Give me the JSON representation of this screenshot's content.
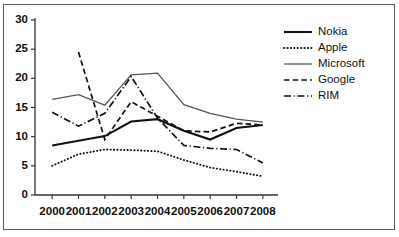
{
  "chart_data": {
    "type": "line",
    "title": "",
    "subtitle": "",
    "xlabel": "",
    "ylabel": "",
    "categories": [
      "2000",
      "2001",
      "2002",
      "2003",
      "2004",
      "2005",
      "2006",
      "2007",
      "2008"
    ],
    "x": [
      2000,
      2001,
      2002,
      2003,
      2004,
      2005,
      2006,
      2007,
      2008
    ],
    "ylim": [
      0,
      30
    ],
    "yticks": [
      "0",
      "5",
      "10",
      "15",
      "20",
      "25",
      "30"
    ],
    "ytick_values": [
      0,
      5,
      10,
      15,
      20,
      25,
      30
    ],
    "grid": false,
    "legend_position": "top-right",
    "series": [
      {
        "name": "Nokia",
        "style": "solid-thick",
        "values": [
          8.5,
          9.3,
          10.1,
          12.6,
          13.0,
          11.0,
          9.5,
          11.5,
          12.0
        ]
      },
      {
        "name": "Apple",
        "style": "dotted",
        "values": [
          5.0,
          7.0,
          7.8,
          7.7,
          7.5,
          6.0,
          4.7,
          4.0,
          3.2
        ]
      },
      {
        "name": "Microsoft",
        "style": "solid-thin",
        "values": [
          16.4,
          17.2,
          15.4,
          20.6,
          20.9,
          15.5,
          14.0,
          13.0,
          12.5
        ]
      },
      {
        "name": "Google",
        "style": "dashed",
        "values": [
          null,
          24.5,
          9.5,
          16.0,
          13.5,
          11.0,
          10.8,
          12.3,
          12.0
        ]
      },
      {
        "name": "RIM",
        "style": "dash-dot",
        "values": [
          14.2,
          11.8,
          14.0,
          20.3,
          13.2,
          8.5,
          8.0,
          7.8,
          5.5
        ]
      }
    ]
  },
  "axis": {
    "y_labels": [
      "30",
      "25",
      "20",
      "15",
      "10",
      "5",
      "0"
    ],
    "x_labels": [
      "2000",
      "2001",
      "2002",
      "2003",
      "2004",
      "2005",
      "2006",
      "2007",
      "2008"
    ]
  },
  "legend": {
    "items": [
      {
        "label": "Nokia",
        "style": "solid-thick"
      },
      {
        "label": "Apple",
        "style": "dotted"
      },
      {
        "label": "Microsoft",
        "style": "solid-thin"
      },
      {
        "label": "Google",
        "style": "dashed"
      },
      {
        "label": "RIM",
        "style": "dash-dot"
      }
    ]
  },
  "colors": {
    "line": "#111111",
    "microsoft_line": "#555555",
    "axis": "#333333",
    "frame": "#5a5a5a",
    "background": "#ffffff"
  }
}
